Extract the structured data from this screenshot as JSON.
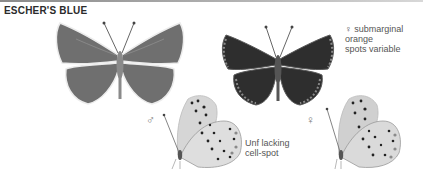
{
  "header": {
    "title": "ESCHER'S BLUE"
  },
  "annotations": {
    "female_upperside": "♀ submarginal orange spots variable",
    "female_upperside_line1": "♀ submarginal orange",
    "female_upperside_line2": "spots variable",
    "male_underside_line1": "Unf lacking",
    "male_underside_line2": "cell-spot"
  },
  "symbols": {
    "male": "♂",
    "female": "♀"
  },
  "figures": [
    {
      "id": "male-upperside",
      "sex": "male",
      "view": "upperside"
    },
    {
      "id": "female-upperside",
      "sex": "female",
      "view": "upperside"
    },
    {
      "id": "male-underside",
      "sex": "male",
      "view": "underside"
    },
    {
      "id": "female-underside",
      "sex": "female",
      "view": "underside"
    }
  ]
}
